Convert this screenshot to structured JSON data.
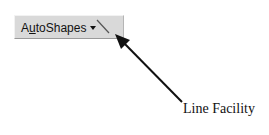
{
  "toolbar": {
    "autoshapes": {
      "label_before": "A",
      "mnemonic": "u",
      "label_after": "toShapes",
      "dropdown_icon": "triangle-down"
    },
    "line_tool_icon": "diagonal-line"
  },
  "annotation": {
    "label": "Line Facility",
    "arrow_color": "#111111"
  }
}
